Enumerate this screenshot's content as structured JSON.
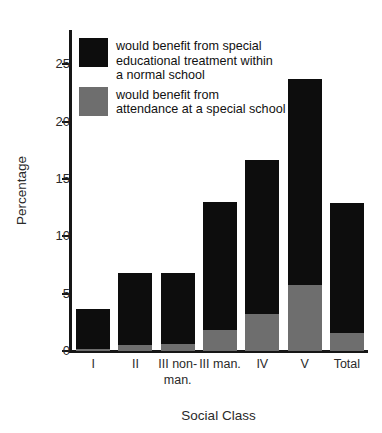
{
  "chart_data": {
    "type": "bar",
    "stacked": true,
    "title": "",
    "xlabel": "Social Class",
    "ylabel": "Percentage",
    "ylim": [
      0,
      28
    ],
    "yticks": [
      0,
      5,
      10,
      15,
      20,
      25
    ],
    "ytick_labels": [
      "0",
      "5",
      "10",
      "15",
      "20",
      "25"
    ],
    "grid": false,
    "legend_position": "upper-left-inside",
    "categories": [
      "I",
      "II",
      "III\nnon-\nman.",
      "III\nman.",
      "IV",
      "V",
      "Total"
    ],
    "category_labels": [
      "I",
      "II",
      "III non-man.",
      "III man.",
      "IV",
      "V",
      "Total"
    ],
    "series": [
      {
        "name": "would benefit from special educational treatment within a normal school",
        "short_name": "special educational treatment within a normal school",
        "color": "#0d0d0d",
        "values": [
          3.5,
          6.3,
          6.2,
          11.2,
          13.5,
          17.9,
          11.3
        ]
      },
      {
        "name": "would benefit from attendance at a special school",
        "short_name": "attendance at a special school",
        "color": "#6e6e6e",
        "values": [
          0.2,
          0.5,
          0.6,
          1.8,
          3.2,
          5.8,
          1.6
        ]
      }
    ],
    "totals": [
      3.7,
      6.8,
      6.8,
      13.0,
      16.7,
      23.7,
      12.9
    ],
    "annotations": []
  },
  "legend": {
    "entries": [
      {
        "swatch": "black",
        "label": "would benefit from special\neducational treatment within\na normal school"
      },
      {
        "swatch": "grey",
        "label": "would benefit from\nattendance at a special school"
      }
    ]
  },
  "axes": {
    "y_title": "Percentage",
    "x_title": "Social Class"
  }
}
